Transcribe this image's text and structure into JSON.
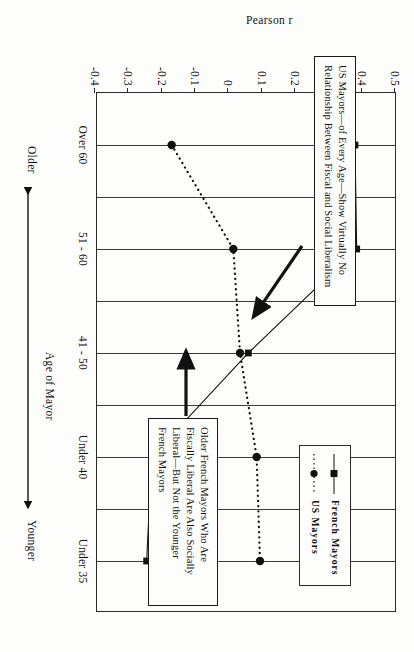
{
  "chart_data": {
    "type": "line",
    "title": "",
    "xlabel": "Age of Mayor",
    "ylabel": "Pearson r",
    "categories": [
      "Over 60",
      "51 - 60",
      "41 - 50",
      "Under 40",
      "Under 35"
    ],
    "yticks": [
      "0.5",
      "0.4",
      "0.3",
      "0.2",
      "0.1",
      "0",
      "-0.1",
      "-0.2",
      "-0.3",
      "-0.4"
    ],
    "ylim": [
      -0.4,
      0.5
    ],
    "grid": true,
    "legend_position": "upper right inside plot",
    "series": [
      {
        "name": "French Mayors",
        "marker": "square",
        "line": "solid",
        "values": [
          0.38,
          0.385,
          0.06,
          -0.23,
          -0.245
        ]
      },
      {
        "name": "US Mayors",
        "marker": "circle",
        "line": "dotted",
        "values": [
          -0.17,
          0.015,
          0.035,
          0.085,
          0.095
        ]
      }
    ],
    "direction_labels": {
      "left": "Older",
      "right": "Younger"
    },
    "annotations": [
      {
        "id": "us-mayors-note",
        "lines": [
          "US Mayors—of Every Age—Show Virtually No",
          "Relationship Between Fiscal and Social Liberalism"
        ],
        "points_to": "US Mayors series, Under 40 region"
      },
      {
        "id": "french-mayors-note",
        "lines": [
          "Older French Mayors Who Are",
          "Fiscally Liberal Are Also Socially",
          "Liberal—But Not the Younger",
          "French Mayors"
        ],
        "points_to": "French Mayors series, Over 60 / 51-60 region"
      }
    ]
  },
  "legend": {
    "items": [
      {
        "label": "French Mayors",
        "marker": "square-marker-icon"
      },
      {
        "label": "US Mayors",
        "marker": "circle-marker-icon"
      }
    ]
  }
}
